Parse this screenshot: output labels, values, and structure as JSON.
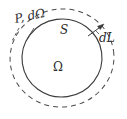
{
  "figure": {
    "name": "domain-boundary-offset-diagram",
    "background_color": "#ffffff",
    "stroke_color": "#3a3a3a",
    "label_color": "#2b2b2b",
    "labels": {
      "perimeter_area": "P, dΩ",
      "surface": "S",
      "domain": "Ω",
      "length_element": "dL"
    },
    "shapes": {
      "inner_boundary": {
        "name": "solid-inner-circle",
        "style": "solid",
        "cx": 62,
        "cy": 58,
        "rx": 40,
        "ry": 39
      },
      "outer_boundary": {
        "name": "dashed-outer-circle",
        "style": "dashed",
        "cx": 62,
        "cy": 58,
        "rx": 52,
        "ry": 49,
        "dash_pattern": "5 4"
      }
    },
    "annotations": {
      "dl_arrow": {
        "name": "dl-outward-arrow",
        "from_x": 88,
        "from_y": 35,
        "to_x": 105,
        "to_y": 24
      },
      "p_leader_1": {
        "name": "p-leader-line",
        "from_x": 19,
        "from_y": 28,
        "to_x": 12,
        "to_y": 40
      },
      "p_leader_2": {
        "name": "domega-leader-line",
        "from_x": 34,
        "from_y": 27,
        "to_x": 26,
        "to_y": 38
      }
    }
  }
}
